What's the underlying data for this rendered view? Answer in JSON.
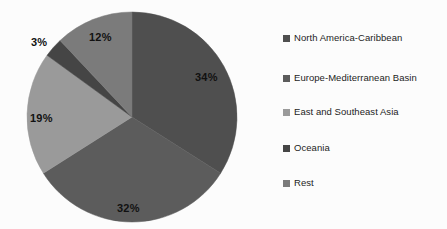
{
  "chart_data": {
    "type": "pie",
    "title": "",
    "categories": [
      "North America-Caribbean",
      "Europe-Mediterranean Basin",
      "East and Southeast Asia",
      "Oceania",
      "Rest"
    ],
    "values": [
      34,
      32,
      19,
      3,
      12
    ],
    "value_labels": [
      "34%",
      "32%",
      "19%",
      "3%",
      "12%"
    ],
    "units": "percent",
    "start_angle_deg": 0,
    "direction": "clockwise",
    "legend_position": "right",
    "grid": false,
    "colors": [
      "#4f4f4f",
      "#5c5c5c",
      "#9a9a9a",
      "#454545",
      "#7b7b7b"
    ],
    "label_placement": [
      "inside",
      "inside",
      "inside",
      "outside",
      "inside"
    ]
  },
  "legend": {
    "items": [
      {
        "label": "North America-Caribbean",
        "color": "#4f4f4f"
      },
      {
        "label": "Europe-Mediterranean Basin",
        "color": "#5c5c5c"
      },
      {
        "label": "East and Southeast Asia",
        "color": "#9a9a9a"
      },
      {
        "label": "Oceania",
        "color": "#454545"
      },
      {
        "label": "Rest",
        "color": "#7b7b7b"
      }
    ]
  },
  "canvas": {
    "background": "#fcfcfc"
  }
}
